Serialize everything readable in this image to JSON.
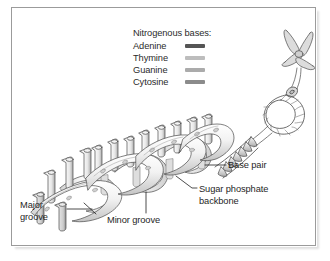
{
  "figure": {
    "kind": "dna-double-helix-diagram",
    "background": "#ffffff",
    "frame_color": "#9b9b9b"
  },
  "legend": {
    "title": "Nitrogenous bases:",
    "items": [
      {
        "label": "Adenine",
        "color": "#555555"
      },
      {
        "label": "Thymine",
        "color": "#bdbdbd"
      },
      {
        "label": "Guanine",
        "color": "#ababab"
      },
      {
        "label": "Cytosine",
        "color": "#8b8b8b"
      }
    ]
  },
  "callouts": {
    "base_pair": "Base pair",
    "sugar_phosphate_backbone": "Sugar phosphate backbone",
    "minor_groove": "Minor groove",
    "major_groove": "Major groove"
  },
  "artwork": {
    "line_color": "#4a4a4a",
    "ribbon_fill": "#ededed",
    "ribbon_shade": "#c9c9c9",
    "cylinder_fill": "#e4e4e4",
    "chromosome_fill": "#d8d8d8"
  }
}
